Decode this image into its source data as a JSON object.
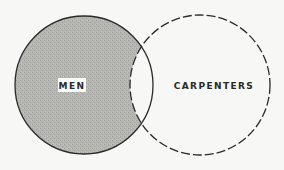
{
  "diagram": {
    "type": "venn",
    "sets": [
      {
        "id": "men",
        "label": "MEN",
        "style": "solid-outline-shaded",
        "fill": "#b3b3b0",
        "stroke": "#2a2a2a"
      },
      {
        "id": "carpenters",
        "label": "CARPENTERS",
        "style": "dashed-outline-unshaded",
        "fill": "none",
        "stroke": "#2a2a2a"
      }
    ],
    "overlap_shaded": false,
    "background": "#f7f7f5"
  }
}
